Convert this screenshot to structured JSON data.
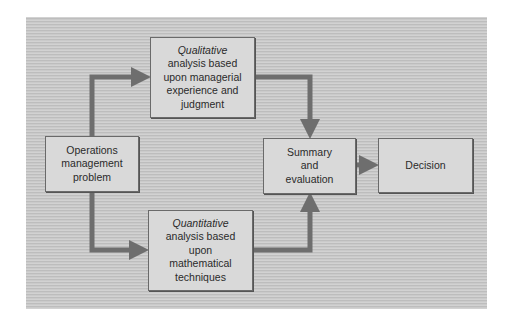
{
  "diagram": {
    "type": "flowchart",
    "nodes": [
      {
        "id": "problem",
        "lines": [
          "Operations",
          "management",
          "problem"
        ]
      },
      {
        "id": "qualitative",
        "emphasis": "Qualitative",
        "lines": [
          "analysis based",
          "upon managerial",
          "experience and",
          "judgment"
        ]
      },
      {
        "id": "quantitative",
        "emphasis": "Quantitative",
        "lines": [
          "analysis based",
          "upon",
          "mathematical",
          "techniques"
        ]
      },
      {
        "id": "summary",
        "lines": [
          "Summary",
          "and",
          "evaluation"
        ]
      },
      {
        "id": "decision",
        "lines": [
          "Decision"
        ]
      }
    ],
    "edges": [
      {
        "from": "problem",
        "to": "qualitative"
      },
      {
        "from": "problem",
        "to": "quantitative"
      },
      {
        "from": "qualitative",
        "to": "summary"
      },
      {
        "from": "quantitative",
        "to": "summary"
      },
      {
        "from": "summary",
        "to": "decision"
      }
    ],
    "colors": {
      "arrow": "#6e6e6e",
      "box_fill": "#d9d9d9",
      "box_border": "#6a6a6a",
      "panel": "#c9c9c9"
    }
  }
}
